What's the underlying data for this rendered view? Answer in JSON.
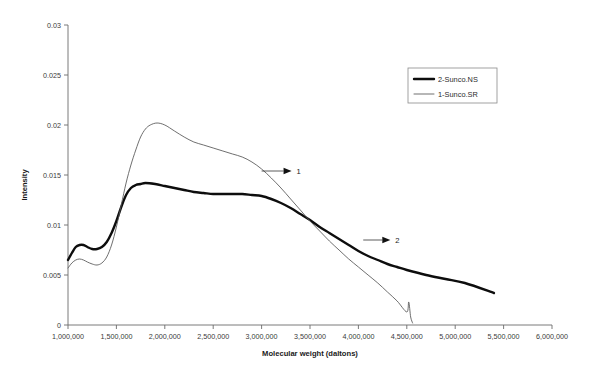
{
  "chart_data": {
    "type": "line",
    "title": "",
    "xlabel": "Molecular weight (daltons)",
    "ylabel": "Intensity",
    "xlim": [
      1000000,
      6000000
    ],
    "ylim": [
      0,
      0.03
    ],
    "grid": false,
    "legend_position": "top-right",
    "xticks": [
      1000000,
      1500000,
      2000000,
      2500000,
      3000000,
      3500000,
      4000000,
      4500000,
      5000000,
      5500000,
      6000000
    ],
    "xtick_labels": [
      "1,000,000",
      "1,500,000",
      "2,000,000",
      "2,500,000",
      "3,000,000",
      "3,500,000",
      "4,000,000",
      "4,500,000",
      "5,000,000",
      "5,500,000",
      "6,000,000"
    ],
    "yticks": [
      0,
      0.005,
      0.01,
      0.015,
      0.02,
      0.025,
      0.03
    ],
    "ytick_labels": [
      "0",
      "0.005",
      "0.01",
      "0.015",
      "0.02",
      "0.025",
      "0.03"
    ],
    "series": [
      {
        "name": "2-Sunco.NS",
        "style": "thick",
        "color": "#0d0d0d",
        "annotation": "2",
        "x": [
          1000000,
          1040000,
          1080000,
          1120000,
          1160000,
          1200000,
          1250000,
          1300000,
          1350000,
          1400000,
          1450000,
          1500000,
          1550000,
          1600000,
          1650000,
          1700000,
          1750000,
          1800000,
          1900000,
          2000000,
          2100000,
          2200000,
          2300000,
          2400000,
          2500000,
          2600000,
          2700000,
          2800000,
          2900000,
          3000000,
          3100000,
          3200000,
          3300000,
          3400000,
          3500000,
          3600000,
          3700000,
          3800000,
          3900000,
          4000000,
          4100000,
          4200000,
          4300000,
          4400000,
          4500000,
          4700000,
          4900000,
          5100000,
          5400000
        ],
        "y": [
          0.0065,
          0.0072,
          0.0078,
          0.008,
          0.008,
          0.0078,
          0.0076,
          0.0076,
          0.0078,
          0.0083,
          0.0092,
          0.0104,
          0.0118,
          0.013,
          0.0137,
          0.014,
          0.0141,
          0.0142,
          0.0141,
          0.0139,
          0.0137,
          0.0135,
          0.0133,
          0.0132,
          0.0131,
          0.0131,
          0.0131,
          0.0131,
          0.013,
          0.0129,
          0.0126,
          0.0122,
          0.0117,
          0.0111,
          0.0105,
          0.0098,
          0.0092,
          0.0086,
          0.008,
          0.0074,
          0.0069,
          0.0065,
          0.0061,
          0.0058,
          0.0055,
          0.005,
          0.0046,
          0.0042,
          0.0032
        ]
      },
      {
        "name": "1-Sunco.SR",
        "style": "thin",
        "color": "#555555",
        "annotation": "1",
        "x": [
          1000000,
          1040000,
          1080000,
          1120000,
          1160000,
          1200000,
          1250000,
          1300000,
          1350000,
          1400000,
          1450000,
          1500000,
          1550000,
          1600000,
          1650000,
          1700000,
          1750000,
          1800000,
          1850000,
          1920000,
          2000000,
          2100000,
          2200000,
          2300000,
          2400000,
          2500000,
          2600000,
          2700000,
          2800000,
          2900000,
          3000000,
          3100000,
          3200000,
          3300000,
          3400000,
          3500000,
          3600000,
          3700000,
          3800000,
          3900000,
          4000000,
          4100000,
          4200000,
          4300000,
          4400000,
          4500000,
          4520000,
          4540000,
          4560000
        ],
        "y": [
          0.0057,
          0.0062,
          0.0065,
          0.0066,
          0.0065,
          0.0063,
          0.0061,
          0.006,
          0.0062,
          0.0068,
          0.008,
          0.0098,
          0.012,
          0.0142,
          0.016,
          0.0175,
          0.0188,
          0.0196,
          0.02,
          0.0202,
          0.02,
          0.0194,
          0.0188,
          0.0183,
          0.018,
          0.0177,
          0.0174,
          0.0171,
          0.0168,
          0.0163,
          0.0156,
          0.0147,
          0.0137,
          0.0126,
          0.0115,
          0.0104,
          0.0094,
          0.0084,
          0.0075,
          0.0066,
          0.0058,
          0.005,
          0.0042,
          0.0033,
          0.0024,
          0.0013,
          0.0023,
          0.0008,
          0.0002
        ]
      }
    ],
    "annotations": [
      {
        "label": "1",
        "target_x": 3000000,
        "target_y": 0.0154,
        "text_x": 3320000,
        "text_y": 0.0154
      },
      {
        "label": "2",
        "target_x": 4050000,
        "target_y": 0.0085,
        "text_x": 4340000,
        "text_y": 0.0085
      }
    ]
  },
  "legend": {
    "items": [
      {
        "label": "2-Sunco.NS",
        "style": "thick"
      },
      {
        "label": "1-Sunco.SR",
        "style": "thin"
      }
    ]
  }
}
